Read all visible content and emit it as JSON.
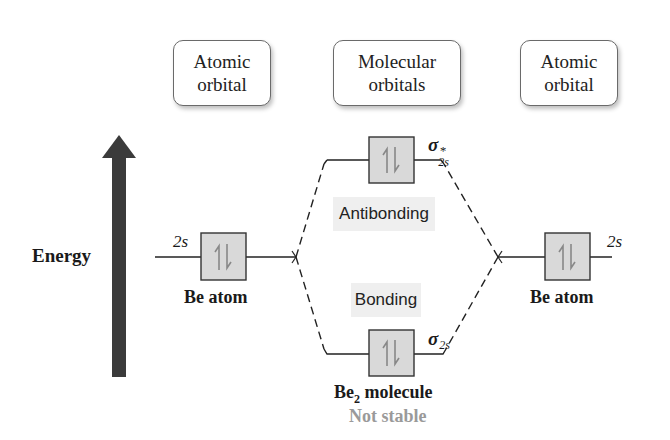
{
  "headers": {
    "left": {
      "line1": "Atomic",
      "line2": "orbital"
    },
    "middle": {
      "line1": "Molecular",
      "line2": "orbitals"
    },
    "right": {
      "line1": "Atomic",
      "line2": "orbital"
    }
  },
  "axis": {
    "label": "Energy",
    "direction": "up"
  },
  "atomic_orbitals": [
    {
      "side": "left",
      "orbital": "2s",
      "electrons": "⇅",
      "atom_label": "Be atom"
    },
    {
      "side": "right",
      "orbital": "2s",
      "electrons": "⇅",
      "atom_label": "Be atom"
    }
  ],
  "molecular_orbitals": {
    "antibonding": {
      "symbol": "σ",
      "subscript": "2s",
      "superscript": "*",
      "electrons": "⇅",
      "label": "Antibonding"
    },
    "bonding": {
      "symbol": "σ",
      "subscript": "2s",
      "electrons": "⇅",
      "label": "Bonding"
    }
  },
  "molecule": {
    "name_prefix": "Be",
    "name_subscript": "2",
    "name_suffix": " molecule",
    "status": "Not stable"
  },
  "colors": {
    "arrow": "#3b3b3b",
    "orbital_box_fill": "#d9d9d9",
    "label_bg": "#efefef",
    "status_text": "#9a9a9a"
  }
}
